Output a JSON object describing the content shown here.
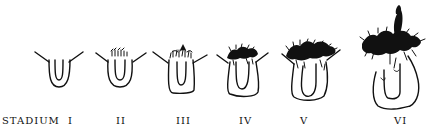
{
  "figure": {
    "row_label": "STADIUM",
    "stages": [
      {
        "numeral": "I",
        "label_x": 68,
        "description": "bud without tentacle tufts"
      },
      {
        "numeral": "II",
        "label_x": 116,
        "description": "first tentacle buds appearing"
      },
      {
        "numeral": "III",
        "label_x": 176,
        "description": "tentacle tuft forming"
      },
      {
        "numeral": "IV",
        "label_x": 239,
        "description": "dense tentacle crown, enlarged body"
      },
      {
        "numeral": "V",
        "label_x": 300,
        "description": "large crown, broadened body"
      },
      {
        "numeral": "VI",
        "label_x": 394,
        "description": "fully developed with elongated apical tuft"
      }
    ]
  },
  "colors": {
    "ink": "#111111",
    "background": "#ffffff"
  }
}
